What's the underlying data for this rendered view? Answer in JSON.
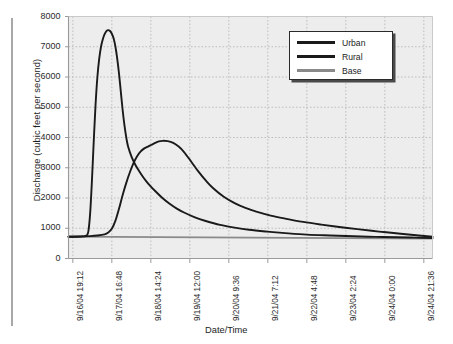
{
  "chart_data": {
    "type": "line",
    "title": "",
    "xlabel": "Date/Time",
    "ylabel": "Discharge (cubic feet per second)",
    "ylim": [
      0,
      8000
    ],
    "ytick_labels": [
      "0",
      "1000",
      "2000",
      "3000",
      "4000",
      "5000",
      "6000",
      "7000",
      "8000"
    ],
    "ytick_values": [
      0,
      1000,
      2000,
      3000,
      4000,
      5000,
      6000,
      7000,
      8000
    ],
    "xtick_labels": [
      "9/16/04 19:12",
      "9/17/04 16:48",
      "9/18/04 14:24",
      "9/19/04 12:00",
      "9/20/04 9:36",
      "9/21/04 7:12",
      "9/22/04 4:48",
      "9/23/04 2:24",
      "9/24/04 0:00",
      "9/24/04 21:36"
    ],
    "grid": true,
    "grid_style": "dotted",
    "legend_position": "top-right",
    "legend_entries": [
      "Urban",
      "Rural",
      "Base"
    ],
    "colors": {
      "urban": "#1a1a1a",
      "rural": "#1a1a1a",
      "base": "#8a8a8a",
      "plot_background": "#ededed",
      "grid": "#b9b9b9",
      "axis": "#9a9a9a"
    },
    "x_hours_range": [
      0,
      201.6
    ],
    "x_tick_hours": [
      2.4,
      24.0,
      45.6,
      67.2,
      88.8,
      110.4,
      132.0,
      153.6,
      175.2,
      196.8
    ],
    "series": [
      {
        "name": "Urban",
        "color": "#1a1a1a",
        "peak_value": 7550,
        "peak_label": "9/17/04 ~21:00",
        "points_hours": [
          0,
          4,
          8,
          10,
          11,
          12,
          13,
          14,
          15,
          16,
          17,
          18,
          19,
          20,
          21,
          22,
          23,
          24,
          25,
          26,
          27,
          28,
          29,
          30,
          31,
          32,
          33,
          35,
          37,
          39,
          41,
          43,
          45,
          48,
          52,
          56,
          60,
          64,
          70,
          76,
          84,
          92,
          100,
          110,
          120,
          132,
          145,
          158,
          170,
          182,
          192,
          201.6
        ],
        "points_values": [
          720,
          720,
          730,
          760,
          900,
          1500,
          2600,
          3900,
          5100,
          6000,
          6600,
          7000,
          7250,
          7420,
          7520,
          7550,
          7520,
          7430,
          7270,
          7000,
          6600,
          6100,
          5500,
          4900,
          4400,
          4000,
          3700,
          3350,
          3100,
          2900,
          2720,
          2560,
          2420,
          2230,
          2000,
          1810,
          1650,
          1520,
          1360,
          1240,
          1110,
          1020,
          950,
          890,
          840,
          790,
          760,
          735,
          715,
          700,
          690,
          680
        ]
      },
      {
        "name": "Rural",
        "color": "#1a1a1a",
        "peak_value": 3900,
        "peak_label": "9/19/04 ~2:00",
        "points_hours": [
          0,
          6,
          12,
          16,
          20,
          22,
          24,
          26,
          28,
          30,
          32,
          34,
          36,
          38,
          40,
          42,
          44,
          46,
          48,
          50,
          52,
          55,
          58,
          61,
          64,
          68,
          72,
          76,
          80,
          86,
          92,
          98,
          104,
          112,
          120,
          130,
          140,
          150,
          160,
          172,
          184,
          194,
          201.6
        ],
        "points_values": [
          720,
          725,
          740,
          760,
          800,
          860,
          980,
          1250,
          1650,
          2100,
          2500,
          2850,
          3150,
          3380,
          3540,
          3640,
          3700,
          3760,
          3820,
          3870,
          3890,
          3880,
          3820,
          3700,
          3520,
          3200,
          2870,
          2580,
          2330,
          2040,
          1830,
          1670,
          1550,
          1420,
          1320,
          1210,
          1120,
          1040,
          970,
          890,
          820,
          760,
          720
        ]
      },
      {
        "name": "Base",
        "color": "#8a8a8a",
        "points_hours": [
          0,
          201.6
        ],
        "points_values": [
          720,
          660
        ]
      }
    ]
  }
}
